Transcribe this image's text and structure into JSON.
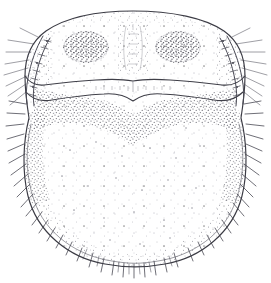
{
  "figure": {
    "style": "stippled ink line drawing",
    "background_color": "#ffffff",
    "ink_color": "#3b3b44",
    "stipple_color": "#6e6e78",
    "canvas": {
      "width": 271,
      "height": 283
    }
  },
  "anatomy": {
    "body_outline": {
      "name": "idiosoma-outline",
      "description": "broad rounded sub-circular body outline",
      "bounds": {
        "left": 24,
        "top": 11,
        "right": 246,
        "bottom": 266
      }
    },
    "propodosoma": {
      "name": "propodosoma",
      "description": "anterior dorsal shield region bearing paired dark stippled patches",
      "top": 11,
      "bottom": 86,
      "patches": [
        {
          "name": "left-dark-patch",
          "cx": 86,
          "cy": 47,
          "rx": 22,
          "ry": 16
        },
        {
          "name": "right-dark-patch",
          "cx": 178,
          "cy": 47,
          "rx": 22,
          "ry": 16
        }
      ],
      "median_pattern": {
        "name": "median-longitudinal-pattern",
        "cx": 133,
        "top": 24,
        "bottom": 72
      }
    },
    "transverse_suture": {
      "name": "transverse-suture",
      "description": "sejugal furrow arcing across the body with a shallow median notch",
      "left_x": 34,
      "right_x": 236,
      "crest_y": 80,
      "notch_x": 133,
      "notch_y": 97
    },
    "opisthosoma": {
      "name": "opisthosoma",
      "description": "large posterior dome bearing dense marginal stippling and marginal setae",
      "top": 90,
      "bottom": 266
    },
    "shoulder_plates": [
      {
        "name": "left-shoulder-plate",
        "description": "ladder-like striated lateral plate",
        "x": 30,
        "y": 38
      },
      {
        "name": "right-shoulder-plate",
        "description": "ladder-like striated lateral plate",
        "x": 215,
        "y": 40
      }
    ],
    "marginal_setae": {
      "name": "marginal-setae",
      "description": "stiff tapering setae radiating outward from the body margin",
      "count_left": 17,
      "count_right": 17,
      "count_ventral": 16
    }
  },
  "labels": {
    "caption": "",
    "scale_bar": ""
  }
}
